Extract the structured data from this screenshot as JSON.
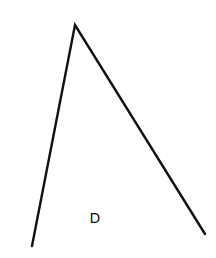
{
  "diagram": {
    "type": "angle",
    "stroke_color": "#111111",
    "stroke_width": 2.4,
    "background": "#ffffff",
    "vertices": {
      "apex": {
        "x": 75,
        "y": 25
      },
      "left_end": {
        "x": 32,
        "y": 246
      },
      "right_end": {
        "x": 205,
        "y": 234
      }
    },
    "label": {
      "text": "D",
      "x": 95,
      "y": 223
    }
  }
}
